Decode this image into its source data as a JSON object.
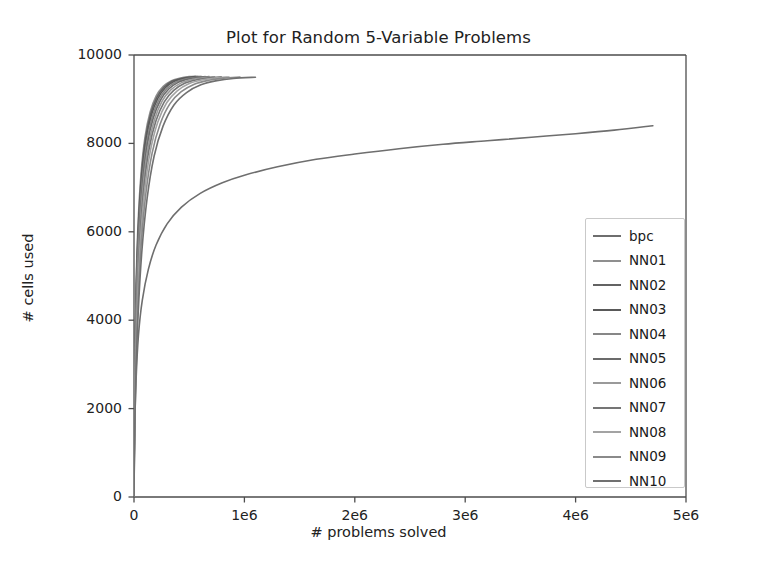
{
  "figure": {
    "background": "#ffffff",
    "plot_background": "#ffffff",
    "axis_color": "#4d4d4d"
  },
  "chart_data": {
    "type": "line",
    "title": "Plot for Random 5-Variable Problems",
    "xlabel": "# problems solved",
    "ylabel": "# cells used",
    "xlim": [
      0,
      5000000
    ],
    "ylim": [
      0,
      10000
    ],
    "xticks": [
      0,
      1000000,
      2000000,
      3000000,
      4000000,
      5000000
    ],
    "xticklabels": [
      "0",
      "1e6",
      "2e6",
      "3e6",
      "4e6",
      "5e6"
    ],
    "yticks": [
      0,
      2000,
      4000,
      6000,
      8000,
      10000
    ],
    "yticklabels": [
      "0",
      "2000",
      "4000",
      "6000",
      "8000",
      "10000"
    ],
    "grid": false,
    "legend_position": "lower right",
    "series": [
      {
        "name": "bpc",
        "color": "#6e6e6e",
        "x": [
          0,
          6000,
          18000,
          40000,
          75000,
          130000,
          200000,
          300000,
          430000,
          600000,
          800000,
          1000000,
          1300000,
          1650000,
          2000000,
          2400000,
          2800000,
          3200000,
          3600000,
          4000000,
          4350000,
          4700000
        ],
        "y": [
          0,
          1450,
          2600,
          3650,
          4450,
          5150,
          5700,
          6180,
          6560,
          6870,
          7110,
          7280,
          7470,
          7640,
          7760,
          7880,
          7980,
          8060,
          8140,
          8220,
          8300,
          8400
        ]
      },
      {
        "name": "NN01",
        "color": "#8f8f8f",
        "x": [
          0,
          3000,
          9000,
          20000,
          38000,
          65000,
          100000,
          145000,
          200000,
          265000,
          340000,
          420000,
          500000,
          560000
        ],
        "y": [
          0,
          1750,
          3300,
          4900,
          6250,
          7350,
          8150,
          8700,
          9070,
          9290,
          9420,
          9480,
          9510,
          9520
        ]
      },
      {
        "name": "NN02",
        "color": "#636363",
        "x": [
          0,
          3000,
          9000,
          21000,
          40000,
          68000,
          104000,
          150000,
          207000,
          272000,
          348000,
          430000,
          515000,
          580000
        ],
        "y": [
          0,
          1700,
          3230,
          4820,
          6180,
          7290,
          8100,
          8660,
          9040,
          9270,
          9410,
          9470,
          9500,
          9515
        ]
      },
      {
        "name": "NN03",
        "color": "#595959",
        "x": [
          0,
          3200,
          9500,
          22000,
          42000,
          71000,
          109000,
          157000,
          216000,
          284000,
          362000,
          448000,
          536000,
          610000
        ],
        "y": [
          0,
          1660,
          3170,
          4750,
          6120,
          7240,
          8060,
          8630,
          9020,
          9260,
          9400,
          9465,
          9500,
          9515
        ]
      },
      {
        "name": "NN04",
        "color": "#878787",
        "x": [
          0,
          3400,
          10000,
          23000,
          44000,
          75000,
          115000,
          165000,
          228000,
          299000,
          381000,
          471000,
          564000,
          645000
        ],
        "y": [
          0,
          1620,
          3110,
          4680,
          6050,
          7180,
          8020,
          8600,
          9000,
          9245,
          9390,
          9460,
          9495,
          9512
        ]
      },
      {
        "name": "NN05",
        "color": "#6b6b6b",
        "x": [
          0,
          3600,
          10500,
          24500,
          46500,
          79000,
          121000,
          174000,
          240000,
          315000,
          401000,
          496000,
          594000,
          680000
        ],
        "y": [
          0,
          1580,
          3050,
          4620,
          5990,
          7130,
          7980,
          8570,
          8980,
          9230,
          9380,
          9455,
          9492,
          9510
        ]
      },
      {
        "name": "NN06",
        "color": "#9a9a9a",
        "x": [
          0,
          3800,
          11200,
          26000,
          49500,
          84000,
          129000,
          186000,
          256000,
          336000,
          428000,
          530000,
          635000,
          730000
        ],
        "y": [
          0,
          1540,
          2980,
          4540,
          5920,
          7070,
          7940,
          8540,
          8960,
          9215,
          9370,
          9448,
          9488,
          9508
        ]
      },
      {
        "name": "NN07",
        "color": "#757575",
        "x": [
          0,
          4100,
          12000,
          28000,
          53000,
          90000,
          138000,
          199000,
          274000,
          360000,
          459000,
          568000,
          681000,
          790000
        ],
        "y": [
          0,
          1490,
          2900,
          4450,
          5840,
          7010,
          7890,
          8510,
          8940,
          9200,
          9360,
          9440,
          9485,
          9505
        ]
      },
      {
        "name": "NN08",
        "color": "#a3a3a3",
        "x": [
          0,
          4400,
          13000,
          30000,
          57000,
          97000,
          149000,
          215000,
          296000,
          389000,
          496000,
          614000,
          736000,
          860000
        ],
        "y": [
          0,
          1440,
          2810,
          4350,
          5750,
          6940,
          7840,
          8480,
          8920,
          9185,
          9350,
          9435,
          9480,
          9503
        ]
      },
      {
        "name": "NN09",
        "color": "#8a8a8a",
        "x": [
          0,
          4800,
          14200,
          33000,
          63000,
          107000,
          164000,
          237000,
          326000,
          428000,
          546000,
          676000,
          810000,
          960000
        ],
        "y": [
          0,
          1380,
          2710,
          4230,
          5650,
          6860,
          7780,
          8440,
          8900,
          9170,
          9340,
          9428,
          9476,
          9500
        ]
      },
      {
        "name": "NN10",
        "color": "#707070",
        "x": [
          0,
          5300,
          15600,
          36500,
          70000,
          119000,
          182000,
          263000,
          362000,
          476000,
          606000,
          751000,
          900000,
          1100000
        ],
        "y": [
          0,
          1310,
          2590,
          4080,
          5520,
          6760,
          7710,
          8390,
          8870,
          9150,
          9325,
          9420,
          9470,
          9498
        ]
      }
    ]
  },
  "legend": {
    "entries": [
      {
        "label": "bpc",
        "color": "#6e6e6e"
      },
      {
        "label": "NN01",
        "color": "#8f8f8f"
      },
      {
        "label": "NN02",
        "color": "#636363"
      },
      {
        "label": "NN03",
        "color": "#595959"
      },
      {
        "label": "NN04",
        "color": "#878787"
      },
      {
        "label": "NN05",
        "color": "#6b6b6b"
      },
      {
        "label": "NN06",
        "color": "#9a9a9a"
      },
      {
        "label": "NN07",
        "color": "#757575"
      },
      {
        "label": "NN08",
        "color": "#a3a3a3"
      },
      {
        "label": "NN09",
        "color": "#8a8a8a"
      },
      {
        "label": "NN10",
        "color": "#707070"
      }
    ]
  }
}
